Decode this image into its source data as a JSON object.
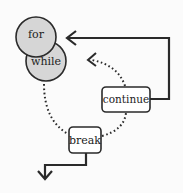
{
  "diagram": {
    "nodes": [
      {
        "id": "for",
        "label": "for",
        "shape": "circle",
        "fill": "#d6d6d6"
      },
      {
        "id": "while",
        "label": "while",
        "shape": "circle",
        "fill": "#d6d6d6"
      },
      {
        "id": "continue",
        "label": "continue",
        "shape": "rounded-box",
        "fill": "#ffffff"
      },
      {
        "id": "break",
        "label": "break",
        "shape": "rounded-box",
        "fill": "#ffffff"
      }
    ],
    "edges": [
      {
        "from": "continue",
        "to": "for",
        "style": "solid",
        "arrow": true
      },
      {
        "from": "continue",
        "to": "loop-start",
        "style": "dotted",
        "arrow": true
      },
      {
        "from": "while",
        "to": "break",
        "style": "dotted",
        "arrow": false
      },
      {
        "from": "break",
        "to": "continue",
        "style": "dotted",
        "arrow": false
      },
      {
        "from": "break",
        "to": "exit",
        "style": "solid",
        "arrow": true
      }
    ],
    "colors": {
      "stroke": "#2a2a2a",
      "circle_fill": "#d6d6d6",
      "background": "#fbfbfb"
    }
  }
}
